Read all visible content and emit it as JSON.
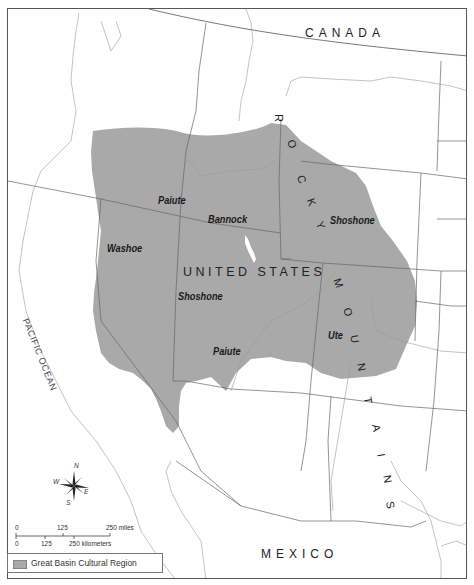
{
  "map": {
    "title": "",
    "countries": {
      "canada": "CANADA",
      "united_states": "UNITED STATES",
      "mexico": "MEXICO"
    },
    "water_bodies": {
      "pacific": "PACIFIC OCEAN"
    },
    "mountain_range": {
      "label": "ROCKY MOUNTAINS",
      "letters": [
        "R",
        "O",
        "C",
        "K",
        "Y",
        "M",
        "O",
        "U",
        "N",
        "T",
        "A",
        "I",
        "N",
        "S"
      ]
    },
    "tribes": [
      {
        "name": "Paiute",
        "id": "paiute-north"
      },
      {
        "name": "Bannock",
        "id": "bannock"
      },
      {
        "name": "Shoshone",
        "id": "shoshone-east"
      },
      {
        "name": "Washoe",
        "id": "washoe"
      },
      {
        "name": "Shoshone",
        "id": "shoshone-west"
      },
      {
        "name": "Paiute",
        "id": "paiute-south"
      },
      {
        "name": "Ute",
        "id": "ute"
      }
    ],
    "region_color": "#a9a9a9",
    "lake_color": "#ffffff"
  },
  "compass": {
    "n": "N",
    "s": "S",
    "e": "E",
    "w": "W"
  },
  "scale_bar": {
    "miles": {
      "ticks": [
        "0",
        "125",
        "250 miles"
      ]
    },
    "kilometers": {
      "ticks": [
        "0",
        "125",
        "250 kilometers"
      ]
    }
  },
  "legend": {
    "items": [
      {
        "label": "Great Basin Cultural Region",
        "color": "#a9a9a9"
      }
    ]
  }
}
